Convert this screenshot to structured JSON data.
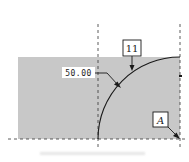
{
  "diagram": {
    "type": "technical-drawing",
    "dimension_label": "50.00",
    "callout_number": "11",
    "datum_label": "A",
    "colors": {
      "fill": "#c8c8c8",
      "line": "#1a1a1a",
      "label_bg": "#ffffff"
    }
  }
}
